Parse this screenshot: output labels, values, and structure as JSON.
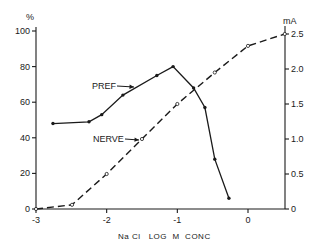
{
  "chart_data": {
    "type": "line",
    "title": "",
    "xlabel": "NaCl LOG M CONC",
    "ylabel_left": "%",
    "ylabel_right": "mA",
    "xlim": [
      -3,
      0.52
    ],
    "ylim_left": [
      0,
      100
    ],
    "ylim_right": [
      0,
      2.5
    ],
    "x_ticks": [
      "-3",
      "-2",
      "-1",
      "0"
    ],
    "y_left_ticks": [
      "0",
      "20",
      "40",
      "60",
      "80",
      "100"
    ],
    "y_right_ticks": [
      "0",
      "0.5",
      "1.0",
      "1.5",
      "2.0",
      "2.5"
    ],
    "grid": false,
    "series": [
      {
        "name": "PREF",
        "axis": "left",
        "style": "solid line, filled dots",
        "x": [
          -2.76,
          -2.25,
          -2.07,
          -1.77,
          -1.29,
          -1.06,
          -0.77,
          -0.61,
          -0.47,
          -0.27
        ],
        "y": [
          48,
          49,
          53,
          64,
          75,
          80,
          68,
          57,
          28,
          6
        ]
      },
      {
        "name": "NERVE",
        "axis": "right",
        "style": "dashed line, open circles",
        "x": [
          -3.0,
          -2.49,
          -2.0,
          -1.5,
          -1.0,
          -0.47,
          0.0,
          0.52
        ],
        "y": [
          0.0,
          0.06,
          0.5,
          1.0,
          1.5,
          1.95,
          2.33,
          2.5
        ]
      }
    ],
    "annotations": [
      {
        "text": "PREF",
        "points_to": "PREF series near x=-1.77"
      },
      {
        "text": "NERVE",
        "points_to": "NERVE series near x=-1.5"
      }
    ]
  },
  "labels": {
    "y_left_unit": "%",
    "y_right_unit": "mA",
    "x_axis_title": "Na Cl   LOG  M  CONC",
    "pref_annotation": "PREF",
    "nerve_annotation": "NERVE"
  }
}
